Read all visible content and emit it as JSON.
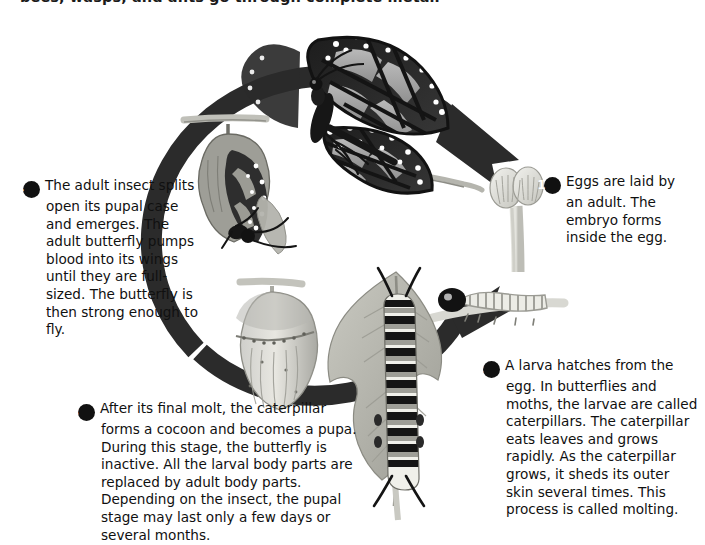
{
  "figure": {
    "title_clipped": "bees, wasps, and ants go through complete metamorphosis.",
    "diagram_type": "butterfly life cycle",
    "colors": {
      "arrow_ring": "#2b2b2b",
      "badge_fill": "#111111",
      "badge_text": "#ffffff",
      "text": "#101010",
      "background": "#ffffff"
    }
  },
  "steps": [
    {
      "number": "1",
      "text": "Eggs are laid by an adult. The embryo forms inside the egg.",
      "illustration": "butterfly-eggs-on-stem"
    },
    {
      "number": "2",
      "text": "A larva hatches from the egg. In butterflies and moths, the larvae are called caterpillars. The caterpillar eats leaves and grows rapidly. As the caterpillar grows, it sheds its outer skin several times. This process is called molting.",
      "illustration": "striped-caterpillar-on-leaf"
    },
    {
      "number": "3",
      "text": "After its final molt, the caterpillar forms a cocoon and becomes a pupa. During this stage, the butterfly is inactive. All the larval body parts are replaced by adult body parts. Depending on the insect, the pupal stage may last only a few days or several months.",
      "illustration": "chrysalis-pupa"
    },
    {
      "number": "4",
      "text": "The adult insect splits open its pupal case and emerges. The adult butterfly pumps blood into its wings until they are full-sized. The butterfly is then strong enough to fly.",
      "illustration": "adult-emerging-from-pupal-case"
    }
  ],
  "illustrations": {
    "adult_butterfly": "monarch-butterfly-perched-on-twig",
    "eggs": "two-ribbed-eggs",
    "larva_hatching": "young-larva-with-dark-head",
    "caterpillar": "monarch-caterpillar-striped",
    "leaf": "chewed-milkweed-leaf",
    "chrysalis": "hanging-chrysalis",
    "emerging_adult": "butterfly-emerging-from-split-chrysalis"
  }
}
